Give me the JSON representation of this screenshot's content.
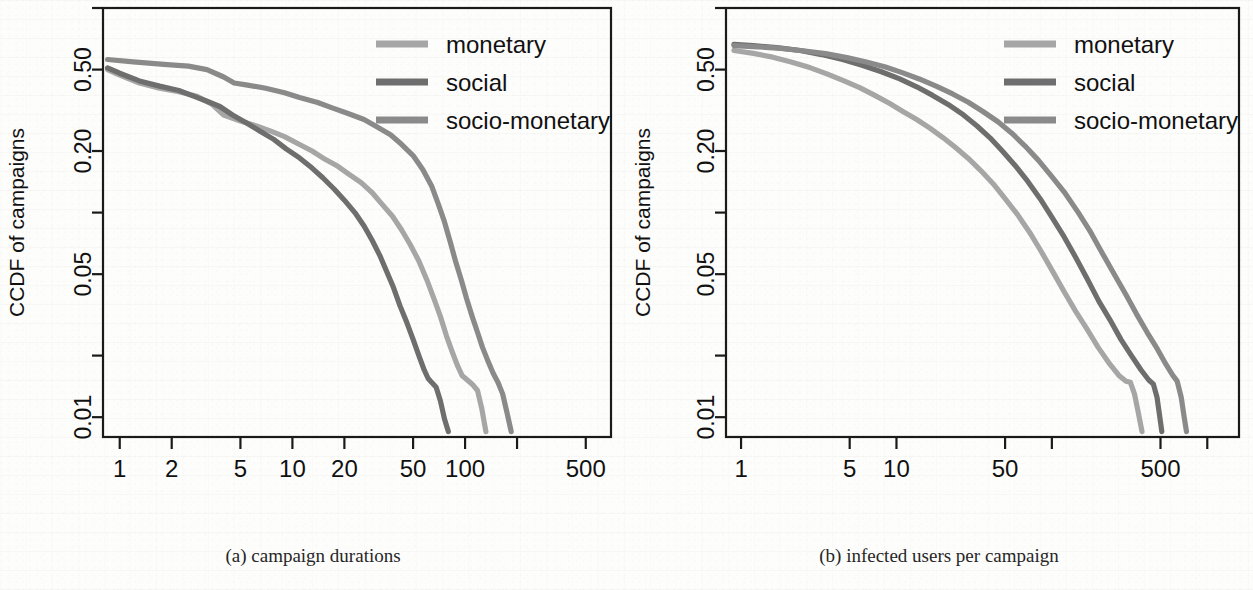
{
  "figure": {
    "panels": [
      {
        "id": "panel-a",
        "caption": "(a) campaign durations",
        "xlabel": "days",
        "ylabel": "CCDF of campaigns"
      },
      {
        "id": "panel-b",
        "caption": "(b) infected users per campaign",
        "xlabel": "infected users",
        "ylabel": "CCDF of campaigns"
      }
    ]
  },
  "legend": {
    "items": [
      {
        "label": "monetary",
        "color": "#a6a6a6"
      },
      {
        "label": "social",
        "color": "#6e6e6e"
      },
      {
        "label": "socio-monetary",
        "color": "#8a8a8a"
      }
    ]
  },
  "colors": {
    "monetary": "#a6a6a6",
    "social": "#6e6e6e",
    "socio_monetary": "#8a8a8a",
    "axis": "#1a1a1a",
    "background": "#fdfdfc"
  },
  "yaxis": {
    "labels": [
      "0.50",
      "0.20",
      "0.05",
      "0.01"
    ],
    "label_values": [
      0.5,
      0.2,
      0.05,
      0.01
    ],
    "unlabeled_ticks": [
      1.0,
      0.1,
      0.02
    ],
    "title": "CCDF of campaigns"
  },
  "chart_data": [
    {
      "type": "line",
      "id": "panel-a",
      "title": "(a) campaign durations",
      "xlabel": "days",
      "ylabel": "CCDF of campaigns",
      "xscale": "log",
      "yscale": "log",
      "xlim": [
        0.8,
        700
      ],
      "ylim": [
        0.008,
        1.0
      ],
      "grid": false,
      "legend_position": "top-right",
      "xticks": [
        1,
        2,
        5,
        10,
        20,
        50,
        100,
        200,
        500
      ],
      "xticklabels": [
        "1",
        "2",
        "5",
        "10",
        "20",
        "50",
        "100",
        "",
        "500"
      ],
      "yticks": [
        1.0,
        0.5,
        0.2,
        0.1,
        0.05,
        0.02,
        0.01
      ],
      "yticklabels": [
        "",
        "0.50",
        "0.20",
        "",
        "0.05",
        "",
        "0.01"
      ],
      "series": [
        {
          "name": "monetary",
          "color": "#a6a6a6",
          "points": [
            [
              0.85,
              0.5
            ],
            [
              1.0,
              0.47
            ],
            [
              1.3,
              0.43
            ],
            [
              1.7,
              0.405
            ],
            [
              2.2,
              0.39
            ],
            [
              2.8,
              0.37
            ],
            [
              3.4,
              0.34
            ],
            [
              4.0,
              0.3
            ],
            [
              5.0,
              0.28
            ],
            [
              6.2,
              0.265
            ],
            [
              7.5,
              0.25
            ],
            [
              9.0,
              0.235
            ],
            [
              11.0,
              0.215
            ],
            [
              13.0,
              0.2
            ],
            [
              15.0,
              0.185
            ],
            [
              18.0,
              0.17
            ],
            [
              21.0,
              0.155
            ],
            [
              25.0,
              0.14
            ],
            [
              29.0,
              0.125
            ],
            [
              33.0,
              0.11
            ],
            [
              38.0,
              0.096
            ],
            [
              43.0,
              0.082
            ],
            [
              48.0,
              0.07
            ],
            [
              54.0,
              0.058
            ],
            [
              60.0,
              0.047
            ],
            [
              66.0,
              0.038
            ],
            [
              72.0,
              0.031
            ],
            [
              78.0,
              0.025
            ],
            [
              84.0,
              0.021
            ],
            [
              90.0,
              0.018
            ],
            [
              96.0,
              0.016
            ],
            [
              103.0,
              0.0152
            ],
            [
              110.0,
              0.0145
            ],
            [
              118.0,
              0.0135
            ],
            [
              125.0,
              0.011
            ],
            [
              132.0,
              0.0085
            ]
          ]
        },
        {
          "name": "social",
          "color": "#6e6e6e",
          "points": [
            [
              0.85,
              0.51
            ],
            [
              1.0,
              0.48
            ],
            [
              1.3,
              0.44
            ],
            [
              1.7,
              0.415
            ],
            [
              2.2,
              0.395
            ],
            [
              2.7,
              0.37
            ],
            [
              3.2,
              0.35
            ],
            [
              3.8,
              0.33
            ],
            [
              4.5,
              0.3
            ],
            [
              5.4,
              0.275
            ],
            [
              6.5,
              0.25
            ],
            [
              7.8,
              0.228
            ],
            [
              9.2,
              0.205
            ],
            [
              11.0,
              0.185
            ],
            [
              13.0,
              0.165
            ],
            [
              15.0,
              0.148
            ],
            [
              17.5,
              0.13
            ],
            [
              20.0,
              0.115
            ],
            [
              23.0,
              0.1
            ],
            [
              26.0,
              0.086
            ],
            [
              29.0,
              0.073
            ],
            [
              32.0,
              0.062
            ],
            [
              35.0,
              0.052
            ],
            [
              38.5,
              0.043
            ],
            [
              42.0,
              0.035
            ],
            [
              46.0,
              0.029
            ],
            [
              50.0,
              0.024
            ],
            [
              54.0,
              0.02
            ],
            [
              58.0,
              0.017
            ],
            [
              61.0,
              0.0155
            ],
            [
              64.0,
              0.0148
            ],
            [
              68.0,
              0.014
            ],
            [
              72.0,
              0.012
            ],
            [
              76.0,
              0.0098
            ],
            [
              80.0,
              0.0085
            ]
          ]
        },
        {
          "name": "socio-monetary",
          "color": "#8a8a8a",
          "points": [
            [
              0.85,
              0.56
            ],
            [
              1.2,
              0.545
            ],
            [
              1.8,
              0.53
            ],
            [
              2.5,
              0.52
            ],
            [
              3.2,
              0.5
            ],
            [
              4.0,
              0.46
            ],
            [
              4.6,
              0.43
            ],
            [
              5.5,
              0.42
            ],
            [
              7.0,
              0.405
            ],
            [
              9.0,
              0.385
            ],
            [
              11.0,
              0.365
            ],
            [
              14.0,
              0.345
            ],
            [
              17.0,
              0.325
            ],
            [
              21.0,
              0.305
            ],
            [
              26.0,
              0.285
            ],
            [
              31.0,
              0.262
            ],
            [
              37.0,
              0.24
            ],
            [
              43.0,
              0.215
            ],
            [
              50.0,
              0.19
            ],
            [
              57.0,
              0.162
            ],
            [
              64.0,
              0.135
            ],
            [
              70.0,
              0.11
            ],
            [
              76.0,
              0.09
            ],
            [
              82.0,
              0.072
            ],
            [
              88.0,
              0.058
            ],
            [
              95.0,
              0.047
            ],
            [
              102.0,
              0.038
            ],
            [
              110.0,
              0.031
            ],
            [
              118.0,
              0.026
            ],
            [
              126.0,
              0.022
            ],
            [
              135.0,
              0.019
            ],
            [
              145.0,
              0.0165
            ],
            [
              155.0,
              0.0148
            ],
            [
              165.0,
              0.013
            ],
            [
              175.0,
              0.0105
            ],
            [
              185.0,
              0.0085
            ]
          ]
        }
      ]
    },
    {
      "type": "line",
      "id": "panel-b",
      "title": "(b) infected users per campaign",
      "xlabel": "infected users",
      "ylabel": "CCDF of campaigns",
      "xscale": "log",
      "yscale": "log",
      "xlim": [
        0.8,
        1600
      ],
      "ylim": [
        0.008,
        1.0
      ],
      "grid": false,
      "legend_position": "top-right",
      "xticks": [
        1,
        5,
        10,
        50,
        100,
        500,
        1000
      ],
      "xticklabels": [
        "1",
        "5",
        "10",
        "50",
        "",
        "500",
        ""
      ],
      "yticks": [
        1.0,
        0.5,
        0.2,
        0.1,
        0.05,
        0.02,
        0.01
      ],
      "yticklabels": [
        "",
        "0.50",
        "0.20",
        "",
        "0.05",
        "",
        "0.01"
      ],
      "series": [
        {
          "name": "monetary",
          "color": "#a6a6a6",
          "points": [
            [
              0.9,
              0.62
            ],
            [
              1.2,
              0.6
            ],
            [
              1.6,
              0.575
            ],
            [
              2.1,
              0.545
            ],
            [
              2.8,
              0.51
            ],
            [
              3.6,
              0.475
            ],
            [
              4.6,
              0.44
            ],
            [
              5.8,
              0.408
            ],
            [
              7.2,
              0.375
            ],
            [
              9.0,
              0.342
            ],
            [
              11.0,
              0.312
            ],
            [
              13.5,
              0.285
            ],
            [
              16.5,
              0.258
            ],
            [
              20.0,
              0.232
            ],
            [
              24.0,
              0.208
            ],
            [
              29.0,
              0.184
            ],
            [
              35.0,
              0.16
            ],
            [
              42.0,
              0.138
            ],
            [
              50.0,
              0.117
            ],
            [
              60.0,
              0.098
            ],
            [
              72.0,
              0.08
            ],
            [
              86.0,
              0.064
            ],
            [
              102.0,
              0.051
            ],
            [
              120.0,
              0.041
            ],
            [
              142.0,
              0.033
            ],
            [
              168.0,
              0.027
            ],
            [
              198.0,
              0.022
            ],
            [
              232.0,
              0.0185
            ],
            [
              270.0,
              0.016
            ],
            [
              300.0,
              0.015
            ],
            [
              320.0,
              0.0148
            ],
            [
              340.0,
              0.013
            ],
            [
              360.0,
              0.0105
            ],
            [
              380.0,
              0.0085
            ]
          ]
        },
        {
          "name": "social",
          "color": "#6e6e6e",
          "points": [
            [
              0.9,
              0.665
            ],
            [
              1.2,
              0.655
            ],
            [
              1.7,
              0.64
            ],
            [
              2.4,
              0.62
            ],
            [
              3.3,
              0.592
            ],
            [
              4.5,
              0.56
            ],
            [
              6.0,
              0.525
            ],
            [
              8.0,
              0.488
            ],
            [
              10.5,
              0.45
            ],
            [
              13.5,
              0.412
            ],
            [
              17.0,
              0.375
            ],
            [
              21.5,
              0.338
            ],
            [
              27.0,
              0.3
            ],
            [
              33.0,
              0.265
            ],
            [
              40.0,
              0.232
            ],
            [
              48.0,
              0.2
            ],
            [
              58.0,
              0.17
            ],
            [
              70.0,
              0.142
            ],
            [
              84.0,
              0.117
            ],
            [
              100.0,
              0.095
            ],
            [
              120.0,
              0.076
            ],
            [
              143.0,
              0.06
            ],
            [
              170.0,
              0.047
            ],
            [
              200.0,
              0.037
            ],
            [
              236.0,
              0.03
            ],
            [
              278.0,
              0.024
            ],
            [
              325.0,
              0.02
            ],
            [
              375.0,
              0.017
            ],
            [
              420.0,
              0.0152
            ],
            [
              450.0,
              0.0145
            ],
            [
              475.0,
              0.0125
            ],
            [
              495.0,
              0.01
            ],
            [
              510.0,
              0.0085
            ]
          ]
        },
        {
          "name": "socio-monetary",
          "color": "#8a8a8a",
          "points": [
            [
              0.9,
              0.655
            ],
            [
              1.2,
              0.648
            ],
            [
              1.8,
              0.635
            ],
            [
              2.5,
              0.618
            ],
            [
              3.5,
              0.598
            ],
            [
              4.8,
              0.572
            ],
            [
              6.4,
              0.545
            ],
            [
              8.5,
              0.515
            ],
            [
              11.0,
              0.482
            ],
            [
              14.0,
              0.45
            ],
            [
              18.0,
              0.415
            ],
            [
              23.0,
              0.38
            ],
            [
              29.0,
              0.346
            ],
            [
              36.0,
              0.312
            ],
            [
              45.0,
              0.278
            ],
            [
              55.0,
              0.245
            ],
            [
              67.0,
              0.212
            ],
            [
              82.0,
              0.18
            ],
            [
              100.0,
              0.15
            ],
            [
              122.0,
              0.124
            ],
            [
              148.0,
              0.1
            ],
            [
              178.0,
              0.08
            ],
            [
              212.0,
              0.063
            ],
            [
              252.0,
              0.05
            ],
            [
              298.0,
              0.04
            ],
            [
              350.0,
              0.032
            ],
            [
              410.0,
              0.026
            ],
            [
              478.0,
              0.0215
            ],
            [
              545.0,
              0.018
            ],
            [
              600.0,
              0.016
            ],
            [
              640.0,
              0.015
            ],
            [
              680.0,
              0.0125
            ],
            [
              710.0,
              0.01
            ],
            [
              735.0,
              0.0085
            ]
          ]
        }
      ]
    }
  ]
}
